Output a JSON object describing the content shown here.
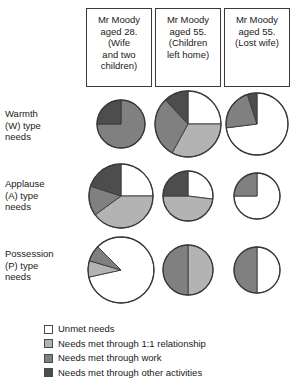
{
  "colors": {
    "unmet": "#ffffff",
    "relationship": "#b3b3b3",
    "work": "#808080",
    "other": "#4d4d4d",
    "outline": "#3a3a3a",
    "text": "#1a1a1a",
    "background": "#ffffff"
  },
  "columns": [
    {
      "id": "aged-28",
      "label": "Mr Moody\naged 28.\n(Wife\nand two\nchildren)"
    },
    {
      "id": "aged-55-children-left-home",
      "label": "Mr Moody\naged 55.\n(Children\nleft home)"
    },
    {
      "id": "aged-55-lost-wife",
      "label": "Mr Moody\naged 55.\n(Lost wife)"
    }
  ],
  "rows": [
    {
      "id": "warmth",
      "label": "Warmth\n(W) type\nneeds"
    },
    {
      "id": "applause",
      "label": "Applause\n(A) type\nneeds"
    },
    {
      "id": "possession",
      "label": "Possession\n(P) type\nneeds"
    }
  ],
  "legend": [
    {
      "id": "unmet",
      "swatch": "#ffffff",
      "label": "Unmet needs"
    },
    {
      "id": "relationship",
      "swatch": "#b3b3b3",
      "label": "Needs met through 1:1 relationship"
    },
    {
      "id": "work",
      "swatch": "#808080",
      "label": "Needs met through work"
    },
    {
      "id": "other",
      "swatch": "#4d4d4d",
      "label": "Needs met through other activities"
    }
  ],
  "chart_data": {
    "type": "pie",
    "legend_position": "bottom-left",
    "category_keys": [
      "unmet",
      "relationship",
      "work",
      "other"
    ],
    "category_labels": [
      "Unmet needs",
      "Needs met through 1:1 relationship",
      "Needs met through work",
      "Needs met through other activities"
    ],
    "category_colors": [
      "#ffffff",
      "#b3b3b3",
      "#808080",
      "#4d4d4d"
    ],
    "note": "Pie radius encodes the overall size of that need at that life stage; slice shares are percentages of each pie.",
    "pies": [
      {
        "row": "warmth",
        "column": "aged-28",
        "cx": 121,
        "cy": 124,
        "radius": 24,
        "start_angle": 0,
        "values": {
          "unmet": 0,
          "relationship": 0,
          "work": 75,
          "other": 25
        }
      },
      {
        "row": "warmth",
        "column": "aged-55-children-left-home",
        "cx": 188,
        "cy": 124,
        "radius": 33,
        "start_angle": 0,
        "values": {
          "unmet": 25,
          "relationship": 33,
          "work": 30,
          "other": 12
        }
      },
      {
        "row": "warmth",
        "column": "aged-55-lost-wife",
        "cx": 257,
        "cy": 124,
        "radius": 31,
        "start_angle": 0,
        "values": {
          "unmet": 73,
          "relationship": 0,
          "work": 22,
          "other": 5
        }
      },
      {
        "row": "applause",
        "column": "aged-28",
        "cx": 121,
        "cy": 196,
        "radius": 32,
        "start_angle": 0,
        "values": {
          "unmet": 25,
          "relationship": 40,
          "work": 15,
          "other": 20
        }
      },
      {
        "row": "applause",
        "column": "aged-55-children-left-home",
        "cx": 188,
        "cy": 196,
        "radius": 25,
        "start_angle": 0,
        "values": {
          "unmet": 27,
          "relationship": 48,
          "work": 0,
          "other": 25
        }
      },
      {
        "row": "applause",
        "column": "aged-55-lost-wife",
        "cx": 257,
        "cy": 196,
        "radius": 23,
        "start_angle": 0,
        "values": {
          "unmet": 75,
          "relationship": 0,
          "work": 25,
          "other": 0
        }
      },
      {
        "row": "possession",
        "column": "aged-28",
        "cx": 121,
        "cy": 270,
        "radius": 33,
        "start_angle": 315,
        "values": {
          "unmet": 84,
          "relationship": 8,
          "work": 8,
          "other": 0
        }
      },
      {
        "row": "possession",
        "column": "aged-55-children-left-home",
        "cx": 188,
        "cy": 270,
        "radius": 25,
        "start_angle": 0,
        "values": {
          "unmet": 0,
          "relationship": 50,
          "work": 50,
          "other": 0
        }
      },
      {
        "row": "possession",
        "column": "aged-55-lost-wife",
        "cx": 257,
        "cy": 270,
        "radius": 23,
        "start_angle": 0,
        "values": {
          "unmet": 50,
          "relationship": 0,
          "work": 50,
          "other": 0
        }
      }
    ]
  }
}
